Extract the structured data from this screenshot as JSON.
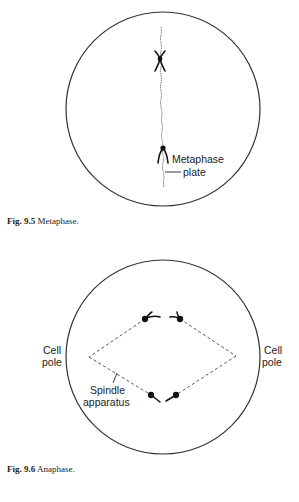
{
  "figures": [
    {
      "id": "fig-9-5",
      "caption": {
        "number": "Fig. 9.5",
        "title": "Metaphase."
      },
      "labels": {
        "metaphase_plate_line1": "Metaphase",
        "metaphase_plate_line2": "plate"
      }
    },
    {
      "id": "fig-9-6",
      "caption": {
        "number": "Fig. 9.6",
        "title": "Anaphase."
      },
      "labels": {
        "left_pole_line1": "Cell",
        "left_pole_line2": "pole",
        "right_pole_line1": "Cell",
        "right_pole_line2": "pole",
        "spindle_line1": "Spindle",
        "spindle_line2": "apparatus"
      }
    }
  ],
  "colors": {
    "stroke": "#222222",
    "background": "#ffffff"
  }
}
